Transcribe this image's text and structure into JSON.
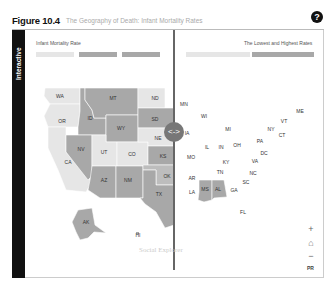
{
  "figure": {
    "number": "Figure 10.4",
    "title": "The Geography of Death: Infant Mortality Rates",
    "help_label": "?"
  },
  "sidebar": {
    "label": "Interactive"
  },
  "left_panel": {
    "title": "Infant Mortality Rate",
    "legend": [
      {
        "color": "#e6e6e6"
      },
      {
        "color": "#a8a8a8"
      },
      {
        "color": "#a8a8a8"
      }
    ]
  },
  "right_panel": {
    "title": "The Lowest and Highest Rates",
    "legend": [
      {
        "color": "#e6e6e6"
      },
      {
        "color": "#a8a8a8"
      }
    ]
  },
  "swipe": {
    "handle_icon": "⟨·⟩",
    "handle_label": "<->"
  },
  "map": {
    "left_states": [
      "WA",
      "OR",
      "CA",
      "ID",
      "MT",
      "WY",
      "NV",
      "UT",
      "CO",
      "AZ",
      "NM",
      "ND",
      "SD",
      "NE",
      "KS",
      "OK",
      "TX",
      "AK",
      "HI"
    ],
    "right_states": [
      "MN",
      "WI",
      "IA",
      "MI",
      "IL",
      "IN",
      "OH",
      "MO",
      "KY",
      "AR",
      "TN",
      "LA",
      "MS",
      "AL",
      "GA",
      "FL",
      "SC",
      "NC",
      "VA",
      "DC",
      "PA",
      "NY",
      "VT",
      "ME",
      "CT"
    ],
    "labels": {
      "WA": "WA",
      "OR": "OR",
      "CA": "CA",
      "ID": "ID",
      "MT": "MT",
      "WY": "WY",
      "NV": "NV",
      "UT": "UT",
      "CO": "CO",
      "AZ": "AZ",
      "NM": "NM",
      "ND": "ND",
      "SD": "SD",
      "NE": "NE",
      "KS": "KS",
      "OK": "OK",
      "TX": "TX",
      "AK": "AK",
      "HI": "HI",
      "MN": "MN",
      "WI": "WI",
      "IA": "IA",
      "MI": "MI",
      "IL": "IL",
      "IN": "IN",
      "OH": "OH",
      "MO": "MO",
      "KY": "KY",
      "AR": "AR",
      "TN": "TN",
      "LA": "LA",
      "MS": "MS",
      "AL": "AL",
      "GA": "GA",
      "FL": "FL",
      "SC": "SC",
      "NC": "NC",
      "VA": "VA",
      "DC": "DC",
      "PA": "PA",
      "NY": "NY",
      "VT": "VT",
      "ME": "ME",
      "CT": "CT"
    }
  },
  "watermark": "Social Explorer",
  "controls": {
    "zoom_in": "+",
    "home": "⌂",
    "zoom_out": "−",
    "pr": "PR"
  }
}
